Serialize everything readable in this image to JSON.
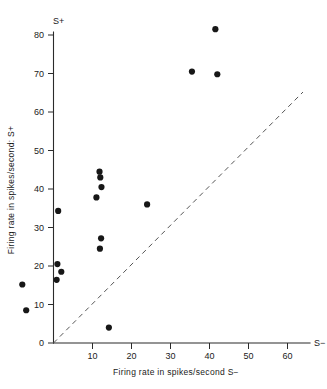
{
  "chart_data": {
    "type": "scatter",
    "title": "",
    "xlabel": "Firing rate in  spikes/second  S−",
    "ylabel": "Firing rate in spikes/second: S+",
    "x_axis_end_label": "S−",
    "y_axis_end_label": "S+",
    "xlim": [
      0,
      65
    ],
    "ylim": [
      0,
      84
    ],
    "xticks": [
      10,
      20,
      30,
      40,
      50,
      60
    ],
    "xtick_labels": [
      "10",
      "20",
      "30",
      "40",
      "50",
      "60"
    ],
    "yticks": [
      0,
      10,
      20,
      30,
      40,
      50,
      60,
      70,
      80
    ],
    "ytick_labels": [
      "0",
      "10",
      "20",
      "30",
      "40",
      "50",
      "60",
      "70",
      "80"
    ],
    "grid": false,
    "legend": false,
    "annotations": [
      {
        "name": "unity-diagonal",
        "kind": "reference-line",
        "style": "dashed",
        "from": [
          0,
          0
        ],
        "to": [
          65,
          65
        ],
        "note": "line of equality S+ = S−"
      }
    ],
    "points": [
      {
        "x": 41.5,
        "y": 81.5
      },
      {
        "x": 35.5,
        "y": 70.5
      },
      {
        "x": 42.0,
        "y": 69.8
      },
      {
        "x": 11.8,
        "y": 44.5
      },
      {
        "x": 12.0,
        "y": 43.0
      },
      {
        "x": 12.3,
        "y": 40.5
      },
      {
        "x": 11.0,
        "y": 37.8
      },
      {
        "x": 24.0,
        "y": 36.0
      },
      {
        "x": 1.2,
        "y": 34.3
      },
      {
        "x": 12.2,
        "y": 27.2
      },
      {
        "x": 11.9,
        "y": 24.5
      },
      {
        "x": 1.0,
        "y": 20.5
      },
      {
        "x": 2.0,
        "y": 18.5
      },
      {
        "x": 0.8,
        "y": 16.4
      },
      {
        "x": -8.0,
        "y": 15.2
      },
      {
        "x": -7.0,
        "y": 8.5
      },
      {
        "x": 14.2,
        "y": 4.0
      }
    ]
  },
  "figure": {
    "axis_color": "#2b2b2b",
    "point_color": "#171717",
    "diagonal_color": "#555555",
    "background": "#ffffff"
  }
}
